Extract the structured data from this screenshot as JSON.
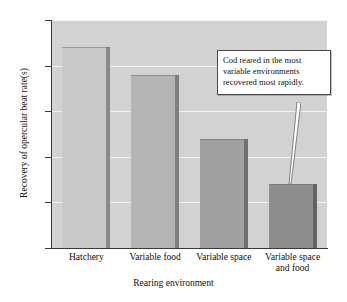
{
  "chart_data": {
    "type": "bar",
    "title": "",
    "xlabel": "Rearing environment",
    "ylabel": "Recovery of opercular beat rate(s)",
    "categories": [
      "Hatchery",
      "Variable food",
      "Variable space",
      "Variable space and food"
    ],
    "values": [
      22,
      19,
      12,
      7
    ],
    "ylim": [
      0,
      25
    ],
    "y_ticks": [
      0,
      5,
      10,
      15,
      20,
      25
    ],
    "y_tick_labels": [
      "0",
      "5",
      "10",
      "15",
      "20",
      "25"
    ],
    "grid": true,
    "legend": "none",
    "bar_colors": [
      "#c9c9c9",
      "#b4b4b4",
      "#a0a0a0",
      "#8e8e8e"
    ],
    "bar_side_colors": [
      "#8a8a8a",
      "#7f7f7f",
      "#6f6f6f",
      "#636363"
    ],
    "plot_background": "#d2d2d2",
    "gridline_color": "#f2f2f2",
    "axis_color": "#3a3a3a"
  },
  "annotation": {
    "text": "Cod reared in the most variable environments recovered most rapidly.",
    "line1": "Cod reared in the most",
    "line2": "variable environments",
    "line3": "recovered most rapidly.",
    "points_to_category": "Variable space and food"
  },
  "x_labels": [
    {
      "line1": "Hatchery",
      "line2": ""
    },
    {
      "line1": "Variable food",
      "line2": ""
    },
    {
      "line1": "Variable space",
      "line2": ""
    },
    {
      "line1": "Variable space",
      "line2": "and food"
    }
  ]
}
